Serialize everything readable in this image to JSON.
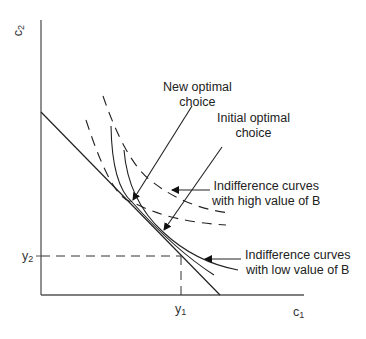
{
  "axes": {
    "y_label": "c",
    "y_label_sub": "2",
    "x_label": "c",
    "x_label_sub": "1",
    "y_tick": "y",
    "y_tick_sub": "2",
    "x_tick": "y",
    "x_tick_sub": "1"
  },
  "annotations": {
    "new_optimal_line1": "New optimal",
    "new_optimal_line2": "choice",
    "initial_optimal_line1": "Initial optimal",
    "initial_optimal_line2": "choice",
    "high_b_line1": "Indifference curves",
    "high_b_line2": "with high value of B",
    "low_b_line1": "Indifference curves",
    "low_b_line2": "with low value of B"
  },
  "colors": {
    "line": "#222222",
    "axis": "#555555"
  }
}
